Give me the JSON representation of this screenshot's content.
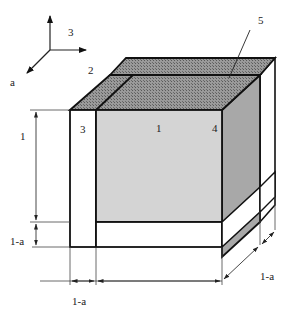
{
  "diagram": {
    "type": "isometric cube with surrounding slabs",
    "axes": {
      "axis_vertical_label": "3",
      "axis_right_label": "",
      "axis_diagonal_label": "a"
    },
    "part_labels": {
      "top_slab": "2",
      "left_slab": "3",
      "front_face": "1",
      "right_edge": "4",
      "top_region": "5"
    },
    "dimensions": {
      "height_main": "1",
      "height_bottom": "1-a",
      "width_left": "1-a",
      "depth_right": "1-a"
    },
    "colors": {
      "front_face": "#d4d4d4",
      "right_face": "#a8a8a8",
      "top_hatch": "#8c8c8c",
      "slab": "#ffffff",
      "outline": "#111111"
    }
  }
}
